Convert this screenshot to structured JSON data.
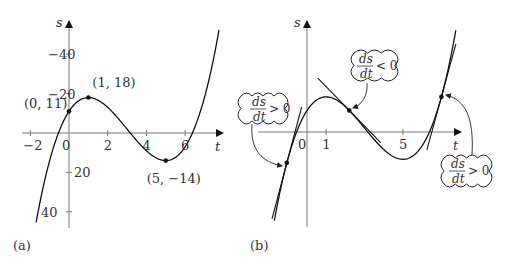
{
  "function": "s = t^3 - 9t^2 + 15t + 11",
  "panels": [
    {
      "label": "(a)",
      "x_axis_label": "t",
      "y_axis_label": "s",
      "x_ticks": [
        "-2",
        "0",
        "2",
        "4",
        "6"
      ],
      "y_ticks": [
        "40",
        "20",
        "-20",
        "-40"
      ],
      "points": [
        {
          "label": "(0, 11)",
          "t": 0,
          "s": 11
        },
        {
          "label": "(1, 18)",
          "t": 1,
          "s": 18
        },
        {
          "label": "(5, −14)",
          "t": 5,
          "s": -14
        }
      ]
    },
    {
      "label": "(b)",
      "x_axis_label": "t",
      "y_axis_label": "s",
      "x_ticks": [
        "0",
        "1",
        "5"
      ],
      "annotations": [
        {
          "text_num": "ds",
          "text_den": "dt",
          "relation": "> 0",
          "position": "left"
        },
        {
          "text_num": "ds",
          "text_den": "dt",
          "relation": "< 0",
          "position": "middle"
        },
        {
          "text_num": "ds",
          "text_den": "dt",
          "relation": "> 0",
          "position": "right"
        }
      ]
    }
  ],
  "chart_data": [
    {
      "type": "line",
      "title": "(a)",
      "xlabel": "t",
      "ylabel": "s",
      "xlim": [
        -2.5,
        8
      ],
      "ylim": [
        -48,
        58
      ],
      "x_ticks": [
        -2,
        0,
        2,
        4,
        6
      ],
      "y_ticks": [
        -40,
        -20,
        20,
        40
      ],
      "series": [
        {
          "name": "s(t)",
          "formula": "t^3-9t^2+15t+11",
          "t_range": [
            -1.7,
            7.75
          ]
        }
      ],
      "marked_points": [
        [
          0,
          11
        ],
        [
          1,
          18
        ],
        [
          5,
          -14
        ]
      ]
    },
    {
      "type": "line",
      "title": "(b)",
      "xlabel": "t",
      "ylabel": "s",
      "x_ticks": [
        0,
        1,
        5
      ],
      "series": [
        {
          "name": "s(t)",
          "formula": "t^3-9t^2+15t+11",
          "t_range": [
            -1.7,
            7.75
          ]
        }
      ],
      "tangent_points": [
        {
          "t": -1.05,
          "slope_sign": "positive",
          "annotation": "ds/dt > 0"
        },
        {
          "t": 2.2,
          "slope_sign": "negative",
          "annotation": "ds/dt < 0"
        },
        {
          "t": 7.0,
          "slope_sign": "positive",
          "annotation": "ds/dt > 0"
        }
      ]
    }
  ]
}
